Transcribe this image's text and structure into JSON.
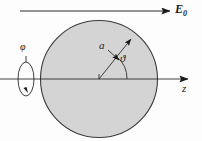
{
  "figure": {
    "type": "physics-schematic",
    "background_color": "#fdfdfd",
    "sphere": {
      "name": "sphere",
      "center_x": 99,
      "center_y": 79,
      "radius": 59,
      "fill_color": "#d4d4d4",
      "stroke_color": "#3a3a3a",
      "radius_label": "a"
    },
    "field_arrow": {
      "name": "uniform-field-arrow",
      "label": "E",
      "subscript": "0",
      "x_start": 20,
      "x_end": 172,
      "y": 11,
      "direction": "right"
    },
    "axis": {
      "name": "z-axis",
      "label": "z",
      "x_start": 0,
      "x_end": 190,
      "y": 79,
      "direction": "right"
    },
    "radius_vector": {
      "name": "radius-vector",
      "label": "a",
      "from_x": 99,
      "from_y": 79,
      "to_x": 134,
      "to_y": 36,
      "angle_deg": 50
    },
    "polar_angle": {
      "name": "polar-angle",
      "label": "ϑ",
      "arc_radius": 28,
      "from_deg": 0,
      "to_deg": 50
    },
    "azimuth": {
      "name": "azimuthal-angle",
      "label": "φ",
      "ellipse_cx": 26,
      "ellipse_cy": 79,
      "ellipse_rx": 8,
      "ellipse_ry": 17,
      "rotation_direction": "counterclockwise"
    },
    "colors": {
      "ink": "#1a1a1a",
      "line": "#3a3a3a",
      "sphere_fill": "#d4d4d4"
    }
  }
}
